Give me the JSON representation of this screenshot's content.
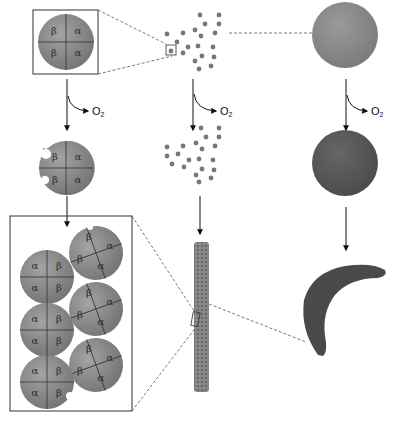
{
  "diagram": {
    "type": "sickle-cell-hemoglobin-polymerization",
    "labels": {
      "oxygen": "O",
      "oxygen_subscript": "2",
      "alpha": "α",
      "beta": "β"
    },
    "columns": [
      {
        "name": "hemoglobin-molecule",
        "stages": [
          "oxygenated tetramer (β α / β α)",
          "deoxygenated tetramer",
          "polymerized tetramers"
        ]
      },
      {
        "name": "hemoglobin-in-solution",
        "stages": [
          "dispersed molecules",
          "deoxygenated dispersed molecules",
          "fiber"
        ]
      },
      {
        "name": "red-blood-cell",
        "stages": [
          "oxygenated round cell",
          "deoxygenated round cell",
          "sickled cell"
        ]
      }
    ],
    "top_tetramer": {
      "subunits": [
        "β",
        "α",
        "β",
        "α"
      ]
    },
    "deoxy_tetramer": {
      "subunits": [
        "β",
        "α",
        "β",
        "α"
      ]
    },
    "polymer_tetramers": [
      {
        "subunits": [
          "β",
          "α",
          "β",
          "α"
        ]
      },
      {
        "subunits": [
          "α",
          "β",
          "α",
          "β"
        ]
      },
      {
        "subunits": [
          "β",
          "α",
          "β",
          "α"
        ]
      },
      {
        "subunits": [
          "α",
          "β",
          "α",
          "β"
        ]
      },
      {
        "subunits": [
          "β",
          "α",
          "β",
          "α"
        ]
      },
      {
        "subunits": [
          "α",
          "β",
          "α",
          "β"
        ]
      }
    ],
    "colors": {
      "molecule_fill": "#8a8a8a",
      "molecule_dark": "#6e6e6e",
      "cell_oxy": "#8c8c8c",
      "cell_deoxy": "#5a5a5a",
      "sickle": "#4a4a4a",
      "line": "#222222",
      "dashed": "#555555"
    }
  }
}
